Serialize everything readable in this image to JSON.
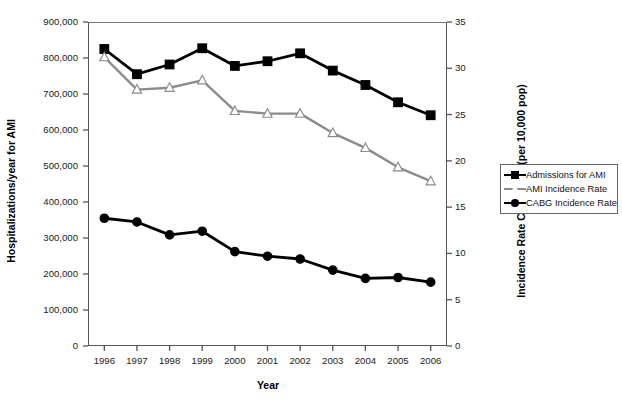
{
  "chart_data": {
    "type": "line",
    "title": "",
    "xlabel": "Year",
    "ylabel": "Hospitalizations/year for AMI",
    "ylabel_secondary": "Incidence Rate CABG/AMI (per 10,000 pop)",
    "categories": [
      "1996",
      "1997",
      "1998",
      "1999",
      "2000",
      "2001",
      "2002",
      "2003",
      "2004",
      "2005",
      "2006"
    ],
    "ylim": [
      0,
      900000
    ],
    "ylim_secondary": [
      0,
      35
    ],
    "yticks": [
      "0",
      "100,000",
      "200,000",
      "300,000",
      "400,000",
      "500,000",
      "600,000",
      "700,000",
      "800,000",
      "900,000"
    ],
    "ytick_values": [
      0,
      100000,
      200000,
      300000,
      400000,
      500000,
      600000,
      700000,
      800000,
      900000
    ],
    "yticks_secondary": [
      "0",
      "5",
      "10",
      "15",
      "20",
      "25",
      "30",
      "35"
    ],
    "ytick_values_secondary": [
      0,
      5,
      10,
      15,
      20,
      25,
      30,
      35
    ],
    "grid": false,
    "legend_position": "right",
    "series": [
      {
        "name": "Admissions for AMI",
        "axis": "left",
        "marker": "square",
        "color": "#000000",
        "marker_fill": "#000000",
        "values": [
          825000,
          755000,
          782000,
          827000,
          778000,
          791000,
          813000,
          765000,
          725000,
          677000,
          641000
        ]
      },
      {
        "name": "AMI Incidence Rate",
        "axis": "right",
        "marker": "triangle",
        "color": "#8c8c8c",
        "marker_fill": "#ffffff",
        "values": [
          31.2,
          27.7,
          27.9,
          28.7,
          25.4,
          25.1,
          25.1,
          23.0,
          21.4,
          19.3,
          17.8
        ]
      },
      {
        "name": "CABG Incidence Rate",
        "axis": "right",
        "marker": "circle",
        "color": "#000000",
        "marker_fill": "#000000",
        "values": [
          13.8,
          13.4,
          12.0,
          12.4,
          10.2,
          9.7,
          9.4,
          8.2,
          7.3,
          7.4,
          6.9
        ]
      }
    ]
  },
  "legend": {
    "items": [
      {
        "label": "Admissions for AMI"
      },
      {
        "label": "AMI Incidence Rate"
      },
      {
        "label": "CABG Incidence Rate"
      }
    ]
  },
  "caption": ""
}
